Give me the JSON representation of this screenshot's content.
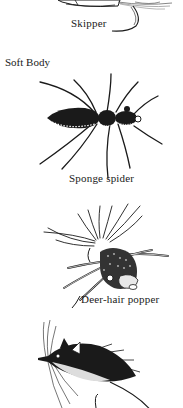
{
  "page": {
    "section_heading": "Soft Body",
    "figures": [
      {
        "id": "skipper",
        "caption": "Skipper"
      },
      {
        "id": "sponge-spider",
        "caption": "Sponge spider"
      },
      {
        "id": "deer-hair-popper",
        "caption": "Deer-hair popper"
      },
      {
        "id": "mouse-fly",
        "caption": ""
      }
    ]
  },
  "colors": {
    "ink": "#1a1a1a",
    "paper": "#ffffff"
  }
}
